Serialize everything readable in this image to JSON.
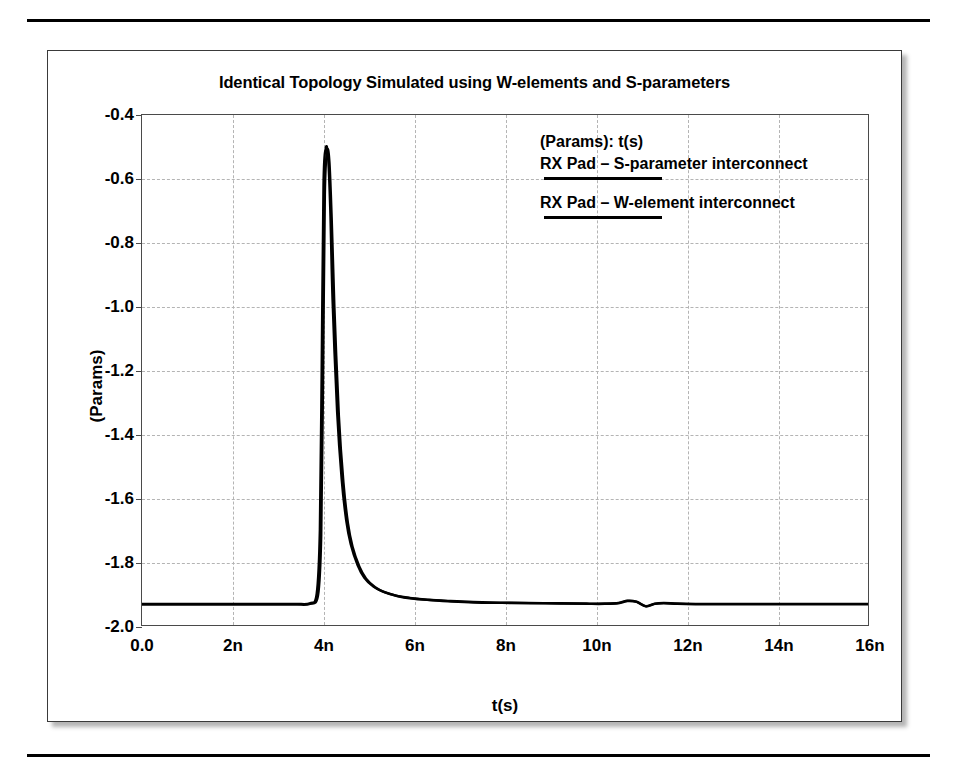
{
  "chart_data": {
    "type": "line",
    "title": "Identical Topology Simulated using W-elements and S-parameters",
    "xlabel": "t(s)",
    "ylabel": "(Params)",
    "xlim": [
      0,
      16
    ],
    "ylim": [
      -2.0,
      -0.4
    ],
    "grid": true,
    "x_unit": "n",
    "xticks": [
      "0.0",
      "2n",
      "4n",
      "6n",
      "8n",
      "10n",
      "12n",
      "14n",
      "16n"
    ],
    "xtick_values": [
      0,
      2,
      4,
      6,
      8,
      10,
      12,
      14,
      16
    ],
    "yticks": [
      "-0.4",
      "-0.6",
      "-0.8",
      "-1.0",
      "-1.2",
      "-1.4",
      "-1.6",
      "-1.8",
      "-2.0"
    ],
    "ytick_values": [
      -0.4,
      -0.6,
      -0.8,
      -1.0,
      -1.2,
      -1.4,
      -1.6,
      -1.8,
      -2.0
    ],
    "legend_position": "inside-top-right",
    "legend_title": "(Params): t(s)",
    "series": [
      {
        "name": "RX Pad – S-parameter interconnect",
        "color": "#000000",
        "x": [
          0,
          0.5,
          1.0,
          1.5,
          2.0,
          2.5,
          3.0,
          3.4,
          3.7,
          3.85,
          3.92,
          3.96,
          4.0,
          4.05,
          4.1,
          4.15,
          4.2,
          4.3,
          4.4,
          4.5,
          4.6,
          4.75,
          4.9,
          5.1,
          5.3,
          5.6,
          5.9,
          6.3,
          6.8,
          7.3,
          7.9,
          8.5,
          9.2,
          9.8,
          10.2,
          10.5,
          10.7,
          10.9,
          11.1,
          11.3,
          11.5,
          11.8,
          12.2,
          12.8,
          13.5,
          14.2,
          15.0,
          16.0
        ],
        "y": [
          -1.932,
          -1.932,
          -1.932,
          -1.932,
          -1.932,
          -1.932,
          -1.932,
          -1.932,
          -1.93,
          -1.9,
          -1.7,
          -1.2,
          -0.62,
          -0.505,
          -0.53,
          -0.7,
          -0.98,
          -1.33,
          -1.54,
          -1.67,
          -1.745,
          -1.81,
          -1.85,
          -1.878,
          -1.893,
          -1.906,
          -1.913,
          -1.919,
          -1.923,
          -1.926,
          -1.928,
          -1.929,
          -1.93,
          -1.931,
          -1.931,
          -1.929,
          -1.922,
          -1.925,
          -1.939,
          -1.931,
          -1.929,
          -1.931,
          -1.932,
          -1.932,
          -1.932,
          -1.932,
          -1.932,
          -1.932
        ]
      },
      {
        "name": "RX Pad – W-element interconnect",
        "color": "#000000",
        "x": [
          0,
          0.5,
          1.0,
          1.5,
          2.0,
          2.5,
          3.0,
          3.4,
          3.7,
          3.88,
          3.95,
          3.99,
          4.03,
          4.08,
          4.13,
          4.18,
          4.24,
          4.34,
          4.44,
          4.54,
          4.64,
          4.79,
          4.94,
          5.14,
          5.34,
          5.64,
          5.94,
          6.34,
          6.84,
          7.34,
          7.94,
          8.54,
          9.24,
          9.84,
          10.2,
          10.5,
          10.7,
          10.9,
          11.1,
          11.3,
          11.5,
          11.8,
          12.2,
          12.8,
          13.5,
          14.2,
          15.0,
          16.0
        ],
        "y": [
          -1.934,
          -1.934,
          -1.934,
          -1.934,
          -1.934,
          -1.934,
          -1.934,
          -1.934,
          -1.932,
          -1.905,
          -1.72,
          -1.23,
          -0.65,
          -0.515,
          -0.545,
          -0.72,
          -1.0,
          -1.345,
          -1.552,
          -1.68,
          -1.752,
          -1.815,
          -1.853,
          -1.88,
          -1.895,
          -1.908,
          -1.915,
          -1.92,
          -1.925,
          -1.928,
          -1.929,
          -1.93,
          -1.931,
          -1.932,
          -1.932,
          -1.93,
          -1.923,
          -1.926,
          -1.94,
          -1.932,
          -1.93,
          -1.932,
          -1.933,
          -1.933,
          -1.933,
          -1.933,
          -1.933,
          -1.933
        ]
      }
    ],
    "annotations": [
      {
        "text": "narrow pulse peak near t = 4n reaching approximately -0.50"
      },
      {
        "text": "small ripple near t = 10.5n to 11.5n"
      }
    ]
  },
  "legend": {
    "title": "(Params): t(s)",
    "entries": [
      {
        "label": "RX Pad – S-parameter interconnect"
      },
      {
        "label": "RX Pad – W-element interconnect"
      }
    ]
  },
  "colors": {
    "curve": "#000000",
    "grid": "#b4b4b4",
    "axis": "#4a4a4a",
    "text": "#000000",
    "page_background": "#ffffff",
    "rule": "#000000"
  }
}
